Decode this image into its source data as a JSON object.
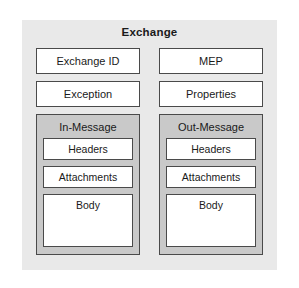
{
  "clipped_caption": "",
  "diagram": {
    "title": "Exchange",
    "colors": {
      "panel_fill": "#e9e9e9",
      "group_fill": "#c9c9c9",
      "box_fill": "#ffffff",
      "border": "#4a4a4a",
      "text": "#1a1a1a"
    },
    "columns": [
      {
        "id": "in",
        "fields": [
          {
            "label": "Exchange ID"
          },
          {
            "label": "Exception"
          }
        ],
        "group": {
          "title": "In-Message",
          "parts": [
            {
              "label": "Headers"
            },
            {
              "label": "Attachments"
            },
            {
              "label": "Body"
            }
          ]
        }
      },
      {
        "id": "out",
        "fields": [
          {
            "label": "MEP"
          },
          {
            "label": "Properties"
          }
        ],
        "group": {
          "title": "Out-Message",
          "parts": [
            {
              "label": "Headers"
            },
            {
              "label": "Attachments"
            },
            {
              "label": "Body"
            }
          ]
        }
      }
    ]
  }
}
